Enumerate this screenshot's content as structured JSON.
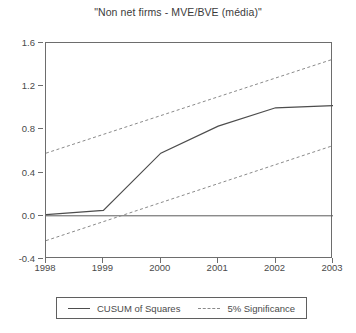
{
  "chart_data": {
    "type": "line",
    "title": "\"Non net firms - MVE/BVE (média)\"",
    "xlabel": "",
    "ylabel": "",
    "xlim": [
      1998,
      2003
    ],
    "ylim": [
      -0.4,
      1.6
    ],
    "xticks": [
      "1998",
      "1999",
      "2000",
      "2001",
      "2002",
      "2003"
    ],
    "yticks": [
      "1.6",
      "1.2",
      "0.8",
      "0.4",
      "0.0",
      "-0.4"
    ],
    "grid": false,
    "legend_position": "bottom",
    "zero_line": 0.0,
    "series": [
      {
        "name": "CUSUM of Squares",
        "style": "solid",
        "color": "#4d4d4d",
        "x": [
          1998,
          1999,
          2000,
          2001,
          2002,
          2003
        ],
        "values": [
          0.01,
          0.05,
          0.58,
          0.83,
          1.0,
          1.02
        ]
      },
      {
        "name": "5% Significance",
        "style": "dashed",
        "color": "#8a8a8a",
        "x": [
          1998,
          2003
        ],
        "values": [
          0.58,
          1.45
        ]
      },
      {
        "name": "5% Significance",
        "style": "dashed",
        "color": "#8a8a8a",
        "x": [
          1998,
          2003
        ],
        "values": [
          -0.23,
          0.65
        ]
      }
    ],
    "legend": [
      {
        "label": "CUSUM of Squares",
        "style": "solid"
      },
      {
        "label": "5% Significance",
        "style": "dashed"
      }
    ]
  }
}
